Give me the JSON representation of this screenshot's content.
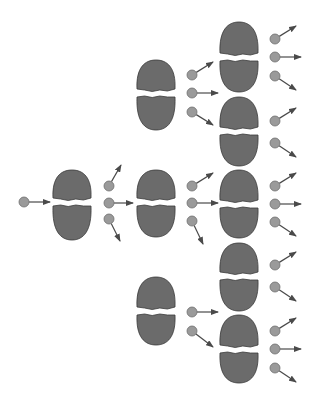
{
  "diagram": {
    "width": 318,
    "height": 396,
    "colors": {
      "background": "#ffffff",
      "nucleus_fill": "#6b6b6b",
      "nucleus_stroke": "#3a3a3a",
      "neutron_fill": "#9a9a9a",
      "neutron_stroke": "#6e6e6e",
      "arrow": "#4a4a4a"
    },
    "nuclei": [
      {
        "id": "gen1",
        "cx": 72,
        "top": 170,
        "split": 202,
        "bottom": 240,
        "rx": 19
      },
      {
        "id": "gen2-top",
        "cx": 156,
        "top": 60,
        "split": 93,
        "bottom": 130,
        "rx": 19
      },
      {
        "id": "gen2-mid",
        "cx": 156,
        "top": 170,
        "split": 202,
        "bottom": 237,
        "rx": 19
      },
      {
        "id": "gen2-bot",
        "cx": 156,
        "top": 277,
        "split": 311,
        "bottom": 345,
        "rx": 19
      },
      {
        "id": "gen3-1",
        "cx": 239,
        "top": 22,
        "split": 57,
        "bottom": 92,
        "rx": 19
      },
      {
        "id": "gen3-2",
        "cx": 239,
        "top": 97,
        "split": 131,
        "bottom": 166,
        "rx": 19
      },
      {
        "id": "gen3-3",
        "cx": 239,
        "top": 170,
        "split": 204,
        "bottom": 238,
        "rx": 19
      },
      {
        "id": "gen3-4",
        "cx": 239,
        "top": 243,
        "split": 276,
        "bottom": 311,
        "rx": 19
      },
      {
        "id": "gen3-5",
        "cx": 239,
        "top": 315,
        "split": 349,
        "bottom": 383,
        "rx": 19
      }
    ],
    "neutrons": [
      {
        "x": 24,
        "y": 202,
        "ax": 50,
        "ay": 202
      },
      {
        "x": 109,
        "y": 186,
        "ax": 121,
        "ay": 165
      },
      {
        "x": 109,
        "y": 203,
        "ax": 133,
        "ay": 203
      },
      {
        "x": 109,
        "y": 219,
        "ax": 120,
        "ay": 241
      },
      {
        "x": 192,
        "y": 75,
        "ax": 213,
        "ay": 62
      },
      {
        "x": 192,
        "y": 93,
        "ax": 218,
        "ay": 93
      },
      {
        "x": 192,
        "y": 112,
        "ax": 213,
        "ay": 125
      },
      {
        "x": 192,
        "y": 186,
        "ax": 213,
        "ay": 173
      },
      {
        "x": 192,
        "y": 203,
        "ax": 218,
        "ay": 203
      },
      {
        "x": 192,
        "y": 221,
        "ax": 203,
        "ay": 244
      },
      {
        "x": 192,
        "y": 312,
        "ax": 218,
        "ay": 312
      },
      {
        "x": 192,
        "y": 331,
        "ax": 213,
        "ay": 347
      },
      {
        "x": 275,
        "y": 39,
        "ax": 296,
        "ay": 26
      },
      {
        "x": 275,
        "y": 57,
        "ax": 301,
        "ay": 57
      },
      {
        "x": 275,
        "y": 76,
        "ax": 296,
        "ay": 90
      },
      {
        "x": 275,
        "y": 121,
        "ax": 296,
        "ay": 108
      },
      {
        "x": 275,
        "y": 143,
        "ax": 296,
        "ay": 157
      },
      {
        "x": 275,
        "y": 186,
        "ax": 296,
        "ay": 173
      },
      {
        "x": 275,
        "y": 204,
        "ax": 301,
        "ay": 204
      },
      {
        "x": 275,
        "y": 222,
        "ax": 296,
        "ay": 236
      },
      {
        "x": 275,
        "y": 265,
        "ax": 296,
        "ay": 252
      },
      {
        "x": 275,
        "y": 287,
        "ax": 296,
        "ay": 301
      },
      {
        "x": 275,
        "y": 331,
        "ax": 296,
        "ay": 318
      },
      {
        "x": 275,
        "y": 349,
        "ax": 301,
        "ay": 349
      },
      {
        "x": 275,
        "y": 368,
        "ax": 296,
        "ay": 382
      }
    ]
  }
}
